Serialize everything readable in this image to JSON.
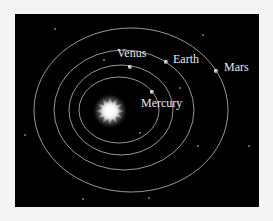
{
  "diagram": {
    "background_color": "#000000",
    "orbit_color": "#bdbdbd",
    "label_color": "#e8e8e8",
    "sun": {
      "label": "Sun",
      "cx": 110,
      "cy": 111,
      "r": 15,
      "points": 12
    },
    "planets": [
      {
        "name": "Mercury",
        "label": "Mercury",
        "orbit": {
          "cx": 119,
          "cy": 110,
          "rx": 40,
          "ry": 33
        },
        "dot": {
          "x": 152,
          "y": 92
        },
        "label_pos": {
          "x": 141,
          "y": 107
        }
      },
      {
        "name": "Venus",
        "label": "Venus",
        "orbit": {
          "cx": 121,
          "cy": 110,
          "rx": 52,
          "ry": 45
        },
        "dot": {
          "x": 130,
          "y": 67
        },
        "label_pos": {
          "x": 117,
          "y": 57
        }
      },
      {
        "name": "Earth",
        "label": "Earth",
        "orbit": {
          "cx": 124,
          "cy": 110,
          "rx": 70,
          "ry": 60
        },
        "dot": {
          "x": 166,
          "y": 62
        },
        "label_pos": {
          "x": 173,
          "y": 63
        }
      },
      {
        "name": "Mars",
        "label": "Mars",
        "orbit": {
          "cx": 131,
          "cy": 110,
          "rx": 97,
          "ry": 82
        },
        "dot": {
          "x": 216,
          "y": 71
        },
        "label_pos": {
          "x": 224,
          "y": 71
        }
      }
    ],
    "stars": [
      [
        55,
        29
      ],
      [
        203,
        35
      ],
      [
        25,
        135
      ],
      [
        140,
        133
      ],
      [
        198,
        146
      ],
      [
        249,
        146
      ],
      [
        83,
        199
      ],
      [
        149,
        198
      ],
      [
        104,
        60
      ],
      [
        180,
        88
      ]
    ]
  }
}
